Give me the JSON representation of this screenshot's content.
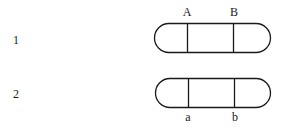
{
  "diagram": {
    "type": "chromosome-pair",
    "rows": [
      {
        "id": "1",
        "label": "1",
        "loci": [
          {
            "label": "A",
            "position": "top"
          },
          {
            "label": "B",
            "position": "top"
          }
        ]
      },
      {
        "id": "2",
        "label": "2",
        "loci": [
          {
            "label": "a",
            "position": "bottom"
          },
          {
            "label": "b",
            "position": "bottom"
          }
        ]
      }
    ],
    "colors": {
      "stroke": "#1a1a1a",
      "background": "#ffffff"
    }
  }
}
